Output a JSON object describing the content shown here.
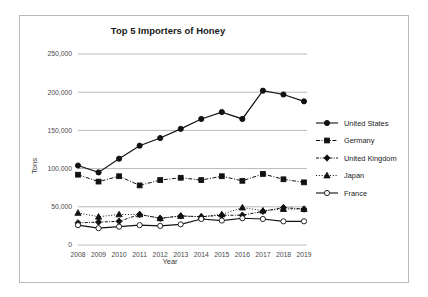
{
  "chart_data": {
    "type": "line",
    "title": "Top 5 Importers of Honey",
    "xlabel": "Year",
    "ylabel": "Tons",
    "categories": [
      "2008",
      "2009",
      "2010",
      "2011",
      "2012",
      "2013",
      "2014",
      "2015",
      "2016",
      "2017",
      "2018",
      "2019"
    ],
    "ylim": [
      0,
      250000
    ],
    "yticks": [
      0,
      50000,
      100000,
      150000,
      200000,
      250000
    ],
    "ytick_labels": [
      "0",
      "50,000",
      "100,000",
      "150,000",
      "200,000",
      "250,000"
    ],
    "grid": "horizontal",
    "legend_position": "right",
    "series": [
      {
        "name": "United States",
        "color": "#111111",
        "line_style": "solid",
        "marker": "circle-filled",
        "values": [
          104000,
          95000,
          113000,
          130000,
          140000,
          152000,
          165000,
          174000,
          165000,
          202000,
          197000,
          188000
        ]
      },
      {
        "name": "Germany",
        "color": "#111111",
        "line_style": "dash-dot",
        "marker": "square-filled",
        "values": [
          92000,
          83000,
          90000,
          78000,
          85000,
          88000,
          85000,
          90000,
          84000,
          93000,
          86000,
          82000
        ]
      },
      {
        "name": "United Kingdom",
        "color": "#111111",
        "line_style": "dash-dot-fine",
        "marker": "diamond-filled",
        "values": [
          29000,
          30000,
          31000,
          40000,
          35000,
          38000,
          37000,
          39000,
          39000,
          44000,
          49000,
          47000
        ]
      },
      {
        "name": "Japan",
        "color": "#111111",
        "line_style": "dotted",
        "marker": "triangle-filled",
        "values": [
          42000,
          37000,
          40000,
          40000,
          35000,
          38000,
          37000,
          40000,
          49000,
          45000,
          47000,
          47000
        ]
      },
      {
        "name": "France",
        "color": "#111111",
        "line_style": "solid",
        "marker": "circle-open",
        "values": [
          26000,
          22000,
          24000,
          26000,
          25000,
          27000,
          34000,
          32000,
          35000,
          34000,
          31000,
          31000
        ]
      }
    ]
  }
}
